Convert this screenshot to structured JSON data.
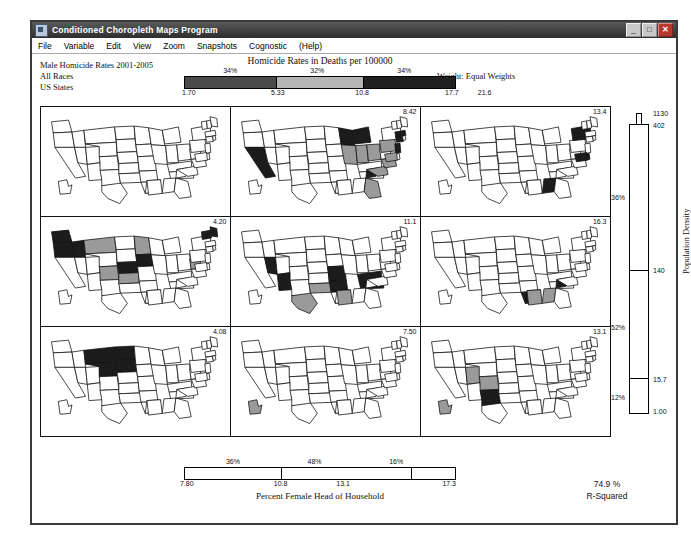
{
  "window": {
    "title": "Conditioned Choropleth Maps Program",
    "icon": "app-icon",
    "buttons": {
      "minimize": "_",
      "maximize": "□",
      "close": "✕"
    }
  },
  "menu": {
    "items": [
      "File",
      "Variable",
      "Edit",
      "View",
      "Zoom",
      "Snapshots",
      "Cognostic",
      "(Help)"
    ]
  },
  "header": {
    "line1": "Male Homicide Rates 2001-2005",
    "line2": "All Races",
    "line3": "US States",
    "weight": "Weight: Equal Weights"
  },
  "top_slider": {
    "title": "Homicide Rates in Deaths per 100000",
    "percents": [
      "34%",
      "32%",
      "34%"
    ],
    "ticks": [
      "1.70",
      "5.33",
      "10.8",
      "17.7",
      "21.6"
    ],
    "segment_colors": [
      "#4a4a4a",
      "#b5b5b5",
      "#202020"
    ]
  },
  "right_slider": {
    "label": "Population Density",
    "ticks": [
      "1130",
      "402",
      "140",
      "15.7",
      "1.00"
    ],
    "percents": [
      "36%",
      "52%",
      "12%"
    ]
  },
  "bottom_slider": {
    "label": "Percent Female Head of Household",
    "percents": [
      "36%",
      "48%",
      "16%"
    ],
    "ticks": [
      "7.80",
      "10.8",
      "13.1",
      "17.3"
    ]
  },
  "rsquared": {
    "value": "74.9 %",
    "label": "R-Squared"
  },
  "panels": [
    {
      "id": "panel-r1c1",
      "value": "",
      "dark": [],
      "gray": []
    },
    {
      "id": "panel-r1c2",
      "value": "8.42",
      "dark": [
        "CA",
        "MI",
        "WI",
        "SC",
        "NJ",
        "CT",
        "MA"
      ],
      "gray": [
        "IL",
        "IN",
        "OH",
        "PA",
        "VA",
        "FL",
        "NC",
        "MD"
      ]
    },
    {
      "id": "panel-r1c3",
      "value": "13.4",
      "dark": [
        "NY",
        "MD",
        "GA",
        "DE"
      ],
      "gray": []
    },
    {
      "id": "panel-r2c1",
      "value": "4.20",
      "dark": [
        "WA",
        "OR",
        "ID",
        "NE",
        "IA",
        "ME",
        "VT",
        "NH"
      ],
      "gray": [
        "MN",
        "CO",
        "KS",
        "WV",
        "MT"
      ]
    },
    {
      "id": "panel-r2c2",
      "value": "11.1",
      "dark": [
        "NV",
        "AZ",
        "MO",
        "TN",
        "KY",
        "AR"
      ],
      "gray": [
        "TX",
        "OK",
        "AL"
      ]
    },
    {
      "id": "panel-r2c3",
      "value": "16.3",
      "dark": [
        "LA",
        "MS",
        "SC"
      ],
      "gray": [
        "AL",
        "GA"
      ]
    },
    {
      "id": "panel-r3c1",
      "value": "4.08",
      "dark": [
        "MT",
        "ND",
        "WY",
        "SD"
      ],
      "gray": []
    },
    {
      "id": "panel-r3c2",
      "value": "7.50",
      "dark": [],
      "gray": [
        "AK"
      ]
    },
    {
      "id": "panel-r3c3",
      "value": "13.1",
      "dark": [
        "NM"
      ],
      "gray": [
        "AK",
        "UT",
        "CO"
      ]
    }
  ],
  "colors": {
    "dark": "#1c1c1c",
    "gray": "#9a9a9a",
    "white": "#ffffff",
    "outline": "#111111",
    "accent_close": "#b43a30"
  }
}
